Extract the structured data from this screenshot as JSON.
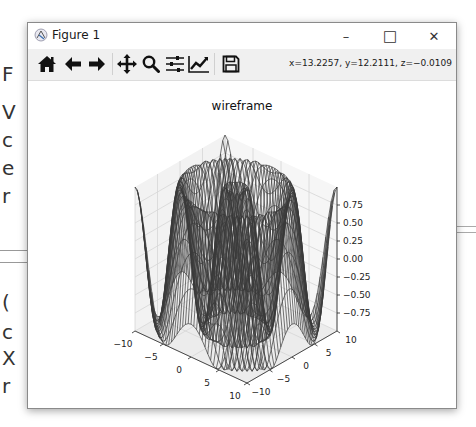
{
  "window": {
    "title": "Figure 1",
    "controls": {
      "minimize": "–",
      "maximize": "□",
      "close": "✕"
    }
  },
  "toolbar": {
    "buttons": [
      {
        "name": "home",
        "icon": "home-icon",
        "tooltip": "Reset original view"
      },
      {
        "name": "back",
        "icon": "arrow-left-icon",
        "tooltip": "Back to previous view"
      },
      {
        "name": "forward",
        "icon": "arrow-right-icon",
        "tooltip": "Forward to next view"
      },
      {
        "name": "pan",
        "icon": "move-icon",
        "tooltip": "Pan axes"
      },
      {
        "name": "zoom",
        "icon": "magnifier-icon",
        "tooltip": "Zoom to rectangle"
      },
      {
        "name": "subplots",
        "icon": "sliders-icon",
        "tooltip": "Configure subplots"
      },
      {
        "name": "customize",
        "icon": "line-chart-icon",
        "tooltip": "Edit axis, curve and image parameters"
      },
      {
        "name": "save",
        "icon": "floppy-disk-icon",
        "tooltip": "Save the figure"
      }
    ],
    "coordinates": "x=13.2257, y=12.2111, z=−0.0109"
  },
  "background_doc": {
    "chars": [
      "F",
      "V",
      "c",
      "e",
      "r",
      "(",
      "c",
      "X",
      "r"
    ]
  },
  "chart_data": {
    "type": "wireframe",
    "title": "wireframe",
    "function": "z = sin(sqrt(x^2 + y^2))",
    "x": {
      "label": "",
      "range": [
        -10,
        10
      ],
      "ticks": [
        -10,
        -5,
        0,
        5,
        10
      ],
      "tick_labels": [
        "−10",
        "−5",
        "0",
        "5",
        "10"
      ]
    },
    "y": {
      "label": "",
      "range": [
        -10,
        10
      ],
      "ticks": [
        -10,
        -5,
        0,
        5,
        10
      ],
      "tick_labels": [
        "−10",
        "−5",
        "0",
        "5",
        "10"
      ]
    },
    "z": {
      "label": "",
      "range": [
        -1,
        1
      ],
      "ticks": [
        -0.75,
        -0.5,
        -0.25,
        0,
        0.25,
        0.5,
        0.75
      ],
      "tick_labels": [
        "−0.75",
        "−0.50",
        "−0.25",
        "0.00",
        "0.25",
        "0.50",
        "0.75"
      ]
    },
    "line_color": "#3a3a3a",
    "pane_color": "#f2f2f2",
    "grid": true
  }
}
